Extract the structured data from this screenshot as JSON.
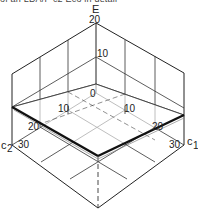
{
  "caption": "of an LDA/F c2 Eco in detail",
  "diagram": {
    "type": "3d-axis-plot",
    "axes": {
      "vertical": {
        "label": "E",
        "ticks": [
          "0",
          "10",
          "20"
        ]
      },
      "c1": {
        "label": "c1",
        "label_main": "c",
        "label_sub": "1",
        "ticks": [
          "10",
          "20",
          "30"
        ]
      },
      "c2": {
        "label": "c2",
        "label_main": "c",
        "label_sub": "2",
        "ticks": [
          "10",
          "20",
          "30"
        ]
      }
    },
    "labels": {
      "E": "E",
      "E20": "20",
      "E10": "10",
      "origin": "0",
      "c2_10": "10",
      "c2_20": "20",
      "c2_30": "30",
      "c1_10": "10",
      "c1_20": "20",
      "c1_30": "30",
      "c1_main": "c",
      "c1_sub": "1",
      "c2_main": "c",
      "c2_sub": "2"
    },
    "surface": "tilted plane within box bounded by c1 ∈ [0,30], c2 ∈ [0,30], E ∈ [0,20]"
  }
}
